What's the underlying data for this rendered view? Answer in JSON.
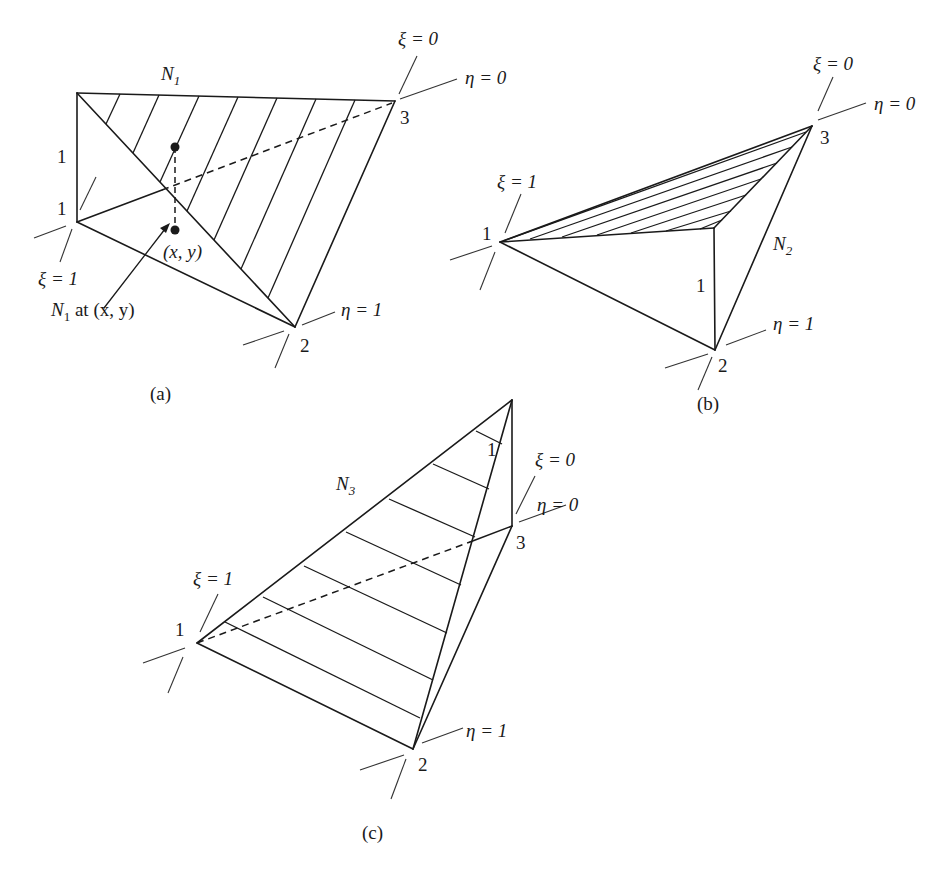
{
  "figures": {
    "a": {
      "caption": "(a)",
      "shape_function": "N",
      "shape_subscript": "1",
      "height_label": "1",
      "node_labels": [
        "1",
        "2",
        "3"
      ],
      "xi_one": "ξ = 1",
      "xi_zero": "ξ = 0",
      "eta_one": "η = 1",
      "eta_zero": "η = 0",
      "point_label": "(x, y)",
      "arrow_label_prefix": "N",
      "arrow_label_sub": "1",
      "arrow_label_suffix": " at (x, y)"
    },
    "b": {
      "caption": "(b)",
      "shape_function": "N",
      "shape_subscript": "2",
      "height_label": "1",
      "node_labels": [
        "1",
        "2",
        "3"
      ],
      "xi_one": "ξ = 1",
      "xi_zero": "ξ = 0",
      "eta_one": "η = 1",
      "eta_zero": "η = 0"
    },
    "c": {
      "caption": "(c)",
      "shape_function": "N",
      "shape_subscript": "3",
      "height_label": "1",
      "node_labels": [
        "1",
        "2",
        "3"
      ],
      "xi_one": "ξ = 1",
      "xi_zero": "ξ = 0",
      "eta_one": "η = 1",
      "eta_zero": "η = 0"
    }
  },
  "colors": {
    "ink": "#1a1a1a",
    "background": "#ffffff"
  }
}
